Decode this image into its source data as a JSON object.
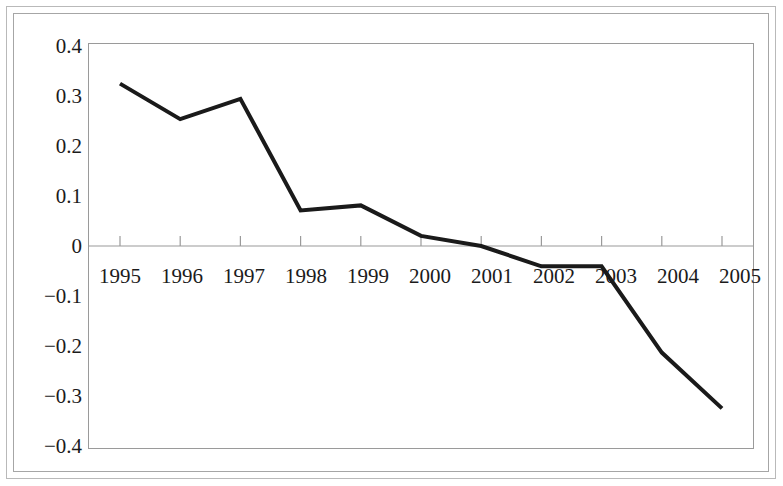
{
  "chart_data": {
    "type": "line",
    "title": "",
    "subtitle": "",
    "xlabel": "",
    "ylabel": "",
    "categories": [
      "1995",
      "1996",
      "1997",
      "1998",
      "1999",
      "2000",
      "2001",
      "2002",
      "2003",
      "2004",
      "2005"
    ],
    "series": [
      {
        "name": "series-1",
        "values": [
          0.32,
          0.25,
          0.29,
          0.07,
          0.08,
          0.02,
          0.0,
          -0.04,
          -0.04,
          -0.21,
          -0.32
        ]
      }
    ],
    "ylim": [
      -0.4,
      0.4
    ],
    "yticks": [
      0.4,
      0.3,
      0.2,
      0.1,
      0,
      -0.1,
      -0.2,
      -0.3,
      -0.4
    ],
    "ytick_labels": [
      "0.4",
      "0.3",
      "0.2",
      "0.1",
      "0",
      "−0.1",
      "−0.2",
      "−0.3",
      "−0.4"
    ],
    "xtick_labels": [
      "1995",
      "1996",
      "1997",
      "1998",
      "1999",
      "2000",
      "2001",
      "2002",
      "2003",
      "2004",
      "2005"
    ],
    "grid": false,
    "legend": "none",
    "line_color": "#1a1a1a",
    "line_width": 4,
    "axis_color": "#9a9a9a",
    "frame_color": "#b9b9b9",
    "background_color": "#ffffff",
    "zero_axis_visible": true,
    "xlabels_position": "below-zero-line"
  }
}
